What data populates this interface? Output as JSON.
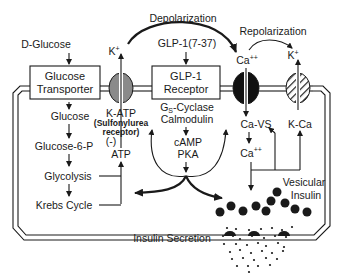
{
  "diagram": {
    "top_labels": {
      "depolarization": "Depolarization",
      "repolarization": "Repolarization"
    },
    "inputs": {
      "d_glucose": "D-Glucose",
      "glp1_peptide": "GLP-1(7-37)"
    },
    "boxes": {
      "glucose_transporter": [
        "Glucose",
        "Transporter"
      ],
      "glp1_receptor": [
        "GLP-1",
        "Receptor"
      ]
    },
    "channels": {
      "k_atp": {
        "ion": "K",
        "ion_sup": "+",
        "label": "K-ATP",
        "sublabel_1": "(Sulfonylurea",
        "sublabel_2": "receptor)",
        "fill": "#8a8a8a"
      },
      "ca": {
        "ion": "Ca",
        "ion_sup": "++",
        "label": "Ca-VS",
        "fill": "#111111"
      },
      "k_ca": {
        "ion": "K",
        "ion_sup": "+",
        "label": "K-Ca",
        "fill": "hatched"
      }
    },
    "metabolism": {
      "steps": [
        "Glucose",
        "Glucose-6-P",
        "Glycolysis",
        "Krebs Cycle"
      ],
      "atp": "ATP",
      "inhibit": "(-)"
    },
    "signaling": {
      "gs_prefix": "G",
      "gs_sub": "S",
      "gs_suffix": "-Cyclase",
      "calmodulin": "Calmodulin",
      "camp": "cAMP",
      "pka": "PKA",
      "ca_intra": "Ca",
      "ca_intra_sup": "++"
    },
    "vesicles": {
      "label_1": "Vesicular",
      "label_2": "Insulin"
    },
    "output": {
      "insulin_secretion": "Insulin Secretion"
    },
    "colors": {
      "ink": "#1a1a1a",
      "k_atp_fill": "#8a8a8a",
      "ca_channel_fill": "#111111",
      "background": "#ffffff"
    }
  }
}
